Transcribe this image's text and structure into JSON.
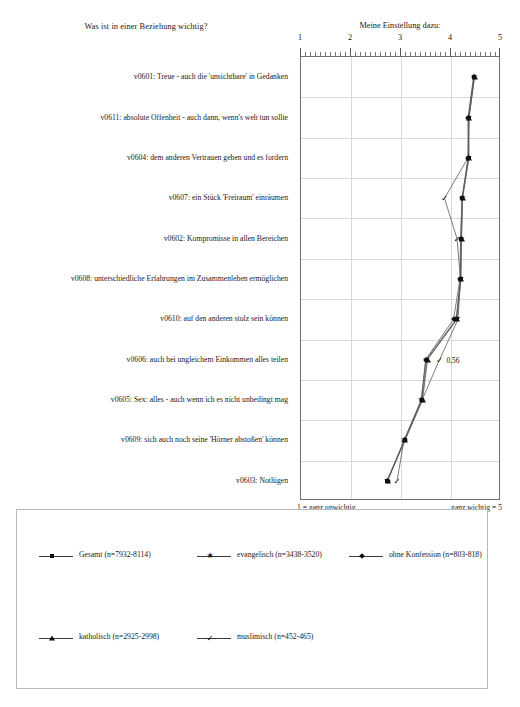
{
  "headings": {
    "left": "Was ist in einer Beziehung wichtig?",
    "right": "Meine Einstellung dazu:"
  },
  "axis": {
    "ticks": [
      "1",
      "2",
      "3",
      "4",
      "5"
    ],
    "min": 1,
    "max": 5,
    "low_caption": "1 = ganz unwichtig",
    "high_caption": "ganz wichtig = 5",
    "span_note": "(Spannweite von n je Kategorie)"
  },
  "annotations": [
    {
      "text": "0,56",
      "series": "muslimisch",
      "category_index": 7,
      "value": 3.77
    }
  ],
  "legend": {
    "items": [
      {
        "label": "Gesamt (n=7932-8114)",
        "marker": "square-marker"
      },
      {
        "label": "evangelisch (n=3438-3520)",
        "marker": "star-marker"
      },
      {
        "label": "ohne Konfession (n=803-818)",
        "marker": "diamond-marker"
      },
      {
        "label": "katholisch (n=2925-2998)",
        "marker": "triangle-marker"
      },
      {
        "label": "muslimisch (n=452-465)",
        "marker": "check-marker"
      }
    ]
  },
  "chart_data": {
    "type": "line",
    "orientation": "horizontal",
    "title": "Meine Einstellung dazu:",
    "xlabel": "1 = ganz unwichtig    ganz wichtig = 5",
    "ylabel": "Was ist in einer Beziehung wichtig?",
    "xlim": [
      1,
      5
    ],
    "grid": true,
    "legend_position": "bottom",
    "categories": [
      "v0601: Treue - auch die 'unsichtbare' in Gedanken",
      "v0611: absolute Offenheit - auch dann, wenn's weh tun sollte",
      "v0604: dem anderen Vertrauen geben und es fordern",
      "v0607: ein Stück 'Freiraum' einräumen",
      "v0602: Kompromisse in allen Bereichen",
      "v0608: unterschiedliche Erfahrungen im Zusammenleben ermöglichen",
      "v0610: auf den anderen stolz sein können",
      "v0606: auch bei ungleichem Einkommen alles teilen",
      "v0605: Sex: alles - auch wenn ich es nicht unbedingt mag",
      "v0609: sich auch noch seine 'Hörner abstoßen' können",
      "v0603: Notlügen"
    ],
    "series": [
      {
        "name": "Gesamt (n=7932-8114)",
        "marker": "square-marker",
        "values": [
          4.46,
          4.35,
          4.35,
          4.22,
          4.2,
          4.19,
          4.11,
          3.52,
          3.42,
          3.07,
          2.72
        ]
      },
      {
        "name": "evangelisch (n=3438-3520)",
        "marker": "star-marker",
        "values": [
          4.46,
          4.35,
          4.35,
          4.23,
          4.21,
          4.19,
          4.1,
          3.5,
          3.4,
          3.06,
          2.72
        ]
      },
      {
        "name": "ohne Konfession (n=803-818)",
        "marker": "diamond-marker",
        "values": [
          4.45,
          4.34,
          4.34,
          4.22,
          4.19,
          4.18,
          4.05,
          3.49,
          3.41,
          3.07,
          2.73
        ]
      },
      {
        "name": "katholisch (n=2925-2998)",
        "marker": "triangle-marker",
        "values": [
          4.47,
          4.36,
          4.36,
          4.23,
          4.21,
          4.2,
          4.12,
          3.53,
          3.43,
          3.08,
          2.73
        ]
      },
      {
        "name": "muslimisch (n=452-465)",
        "marker": "check-marker",
        "values": [
          4.47,
          4.36,
          4.34,
          3.87,
          4.12,
          4.19,
          4.14,
          3.77,
          3.42,
          3.06,
          2.92
        ]
      }
    ]
  }
}
